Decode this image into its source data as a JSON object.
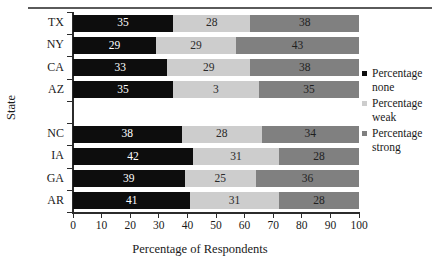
{
  "chart_data": {
    "type": "bar",
    "orientation": "horizontal",
    "stacked": true,
    "title": "",
    "xlabel": "Percentage of Respondents",
    "ylabel": "State",
    "xlim": [
      0,
      100
    ],
    "xticks": [
      0,
      10,
      20,
      30,
      40,
      50,
      60,
      70,
      80,
      90,
      100
    ],
    "xticklabels": [
      "0",
      "10",
      "20",
      "30",
      "40",
      "50",
      "60",
      "70",
      "80",
      "90",
      "100"
    ],
    "grid": false,
    "legend_position": "right",
    "categories": [
      "TX",
      "NY",
      "CA",
      "AZ",
      "",
      "NC",
      "IA",
      "GA",
      "AR"
    ],
    "series": [
      {
        "name": "Percentage none",
        "color": "#0d0d0d",
        "values": [
          35,
          29,
          33,
          35,
          null,
          38,
          42,
          39,
          41
        ]
      },
      {
        "name": "Percentage weak",
        "color": "#cdcdcd",
        "values": [
          28,
          29,
          29,
          3,
          null,
          28,
          31,
          25,
          31
        ]
      },
      {
        "name": "Percentage strong",
        "color": "#808080",
        "values": [
          38,
          43,
          38,
          35,
          null,
          34,
          28,
          36,
          28
        ]
      }
    ],
    "bar_labels": {
      "TX": [
        "35",
        "28",
        "38"
      ],
      "NY": [
        "29",
        "29",
        "43"
      ],
      "CA": [
        "33",
        "29",
        "38"
      ],
      "AZ": [
        "35",
        "3",
        "35"
      ],
      "NC": [
        "38",
        "28",
        "34"
      ],
      "IA": [
        "42",
        "31",
        "28"
      ],
      "GA": [
        "39",
        "25",
        "36"
      ],
      "AR": [
        "41",
        "31",
        "28"
      ]
    }
  },
  "legend": {
    "items": [
      {
        "label_line1": "Percentage",
        "label_line2": "none"
      },
      {
        "label_line1": "Percentage",
        "label_line2": "weak"
      },
      {
        "label_line1": "Percentage",
        "label_line2": "strong"
      }
    ]
  }
}
